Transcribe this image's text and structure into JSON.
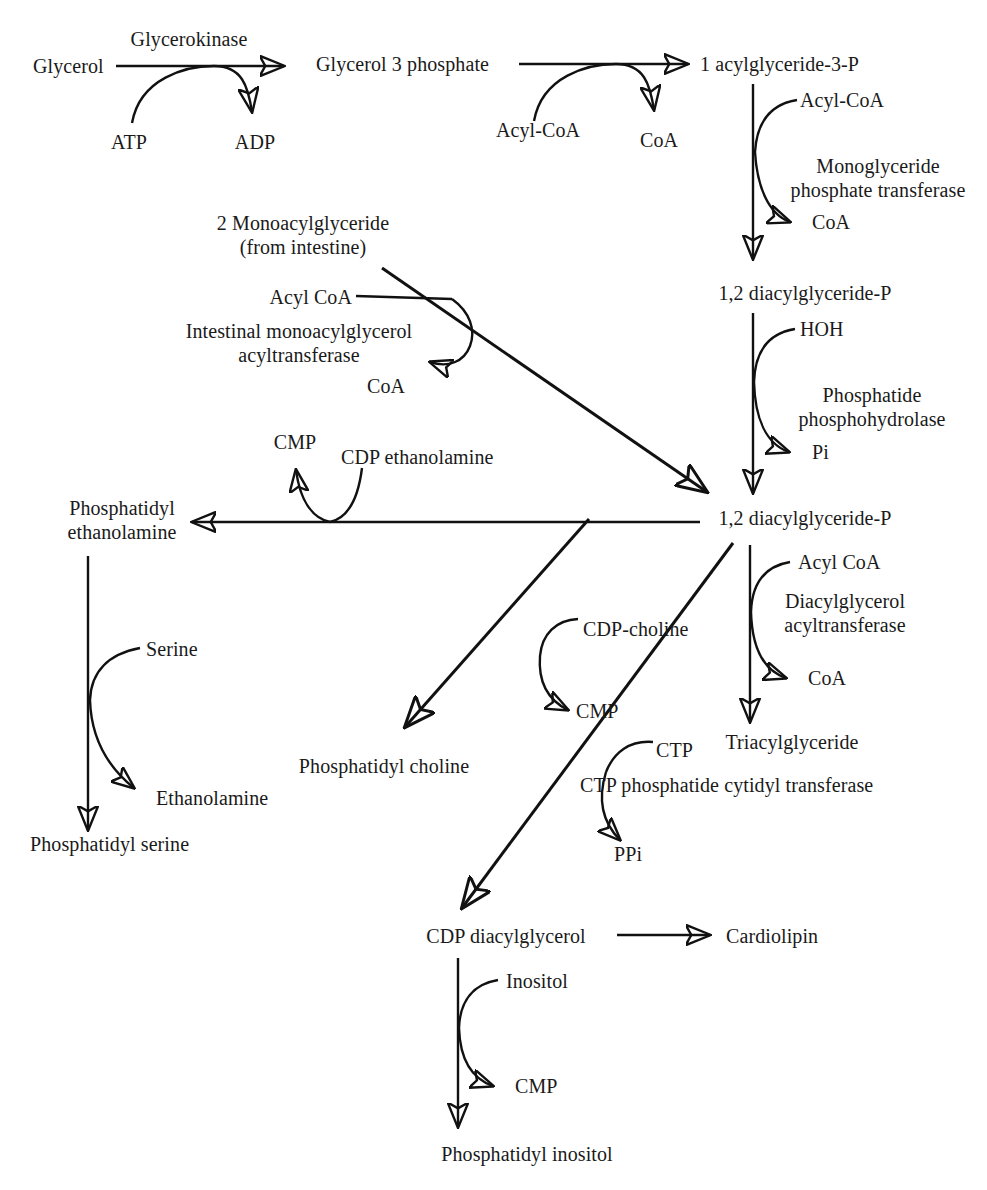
{
  "diagram": {
    "line_color": "#111111",
    "text_color": "#1a1a1a",
    "background": "#ffffff",
    "metabolites": {
      "glycerol": "Glycerol",
      "glycerol_3_phosphate": "Glycerol 3 phosphate",
      "acylglyceride_3_p": "1 acylglyceride-3-P",
      "diacylglyceride_p_1": "1,2 diacylglyceride-P",
      "monoacylglyceride": "2 Monoacylglyceride",
      "monoacylglyceride_source": "(from intestine)",
      "diacylglyceride_p_2": "1,2 diacylglyceride-P",
      "phosphatidyl_ethanolamine_1": "Phosphatidyl",
      "phosphatidyl_ethanolamine_2": "ethanolamine",
      "phosphatidyl_serine": "Phosphatidyl serine",
      "phosphatidyl_choline": "Phosphatidyl choline",
      "triacylglyceride": "Triacylglyceride",
      "cdp_diacylglycerol": "CDP diacylglycerol",
      "cardiolipin": "Cardiolipin",
      "phosphatidyl_inositol": "Phosphatidyl inositol"
    },
    "enzymes": {
      "glycerokinase": "Glycerokinase",
      "monoglyceride_phosphate_transferase_1": "Monoglyceride",
      "monoglyceride_phosphate_transferase_2": "phosphate transferase",
      "intestinal_monoacylglycerol_acyltransferase_1": "Intestinal monoacylglycerol",
      "intestinal_monoacylglycerol_acyltransferase_2": "acyltransferase",
      "phosphatide_phosphohydrolase_1": "Phosphatide",
      "phosphatide_phosphohydrolase_2": "phosphohydrolase",
      "diacylglycerol_acyltransferase_1": "Diacylglycerol",
      "diacylglycerol_acyltransferase_2": "acyltransferase",
      "ctp_phosphatide_cytidyl_transferase": "CTP phosphatide cytidyl transferase"
    },
    "cofactors": {
      "atp": "ATP",
      "adp": "ADP",
      "acyl_coa_1": "Acyl-CoA",
      "coa_1": "CoA",
      "acyl_coa_2": "Acyl-CoA",
      "coa_2": "CoA",
      "acyl_coa_3": "Acyl CoA",
      "coa_3": "CoA",
      "hoh": "HOH",
      "pi": "Pi",
      "cmp_1": "CMP",
      "cdp_ethanolamine": "CDP ethanolamine",
      "serine": "Serine",
      "ethanolamine": "Ethanolamine",
      "cdp_choline": "CDP-choline",
      "cmp_2": "CMP",
      "acyl_coa_4": "Acyl CoA",
      "coa_4": "CoA",
      "ctp": "CTP",
      "ppi": "PPi",
      "inositol": "Inositol",
      "cmp_3": "CMP"
    }
  }
}
